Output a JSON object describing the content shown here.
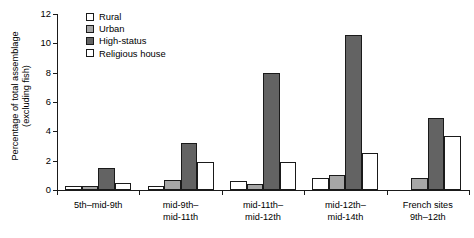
{
  "chart_data": {
    "type": "bar",
    "title": "",
    "xlabel": "",
    "ylabel_line1": "Percentage of total assemblage",
    "ylabel_line2": "(excluding fish)",
    "ylim": [
      0,
      12
    ],
    "yticks": [
      0,
      2,
      4,
      6,
      8,
      10,
      12
    ],
    "ytick_labels": [
      "0",
      "2",
      "4",
      "6",
      "8",
      "10",
      "12"
    ],
    "grid": false,
    "legend_position": "top-left",
    "categories": [
      "5th–mid-9th",
      "mid-9th–\nmid-11th",
      "mid-11th–\nmid-12th",
      "mid-12th–\nmid-14th",
      "French sites\n9th–12th"
    ],
    "category_lines": [
      [
        "5th–mid-9th"
      ],
      [
        "mid-9th–",
        "mid-11th"
      ],
      [
        "mid-11th–",
        "mid-12th"
      ],
      [
        "mid-12th–",
        "mid-14th"
      ],
      [
        "French sites",
        "9th–12th"
      ]
    ],
    "series": [
      {
        "name": "Rural",
        "color": "#ffffff",
        "values": [
          0.3,
          0.3,
          0.6,
          0.85,
          0
        ]
      },
      {
        "name": "Urban",
        "color": "#a6a6a6",
        "values": [
          0.25,
          0.7,
          0.4,
          1.0,
          0.85
        ]
      },
      {
        "name": "High-status",
        "color": "#636363",
        "values": [
          1.5,
          3.2,
          8.0,
          10.6,
          4.9
        ]
      },
      {
        "name": "Religious house",
        "color": "#ffffff",
        "values": [
          0.5,
          1.9,
          1.9,
          2.5,
          3.7
        ]
      }
    ]
  },
  "legend": {
    "items": [
      {
        "label": "Rural",
        "color": "#ffffff"
      },
      {
        "label": "Urban",
        "color": "#a6a6a6"
      },
      {
        "label": "High-status",
        "color": "#636363"
      },
      {
        "label": "Religious house",
        "color": "#ffffff"
      }
    ]
  },
  "axis": {
    "y_title_line1": "Percentage of total assemblage",
    "y_title_line2": "(excluding fish)",
    "tick_labels": [
      "0",
      "2",
      "4",
      "6",
      "8",
      "10",
      "12"
    ]
  },
  "colors": {
    "axis": "#1a1a1a",
    "rural": "#ffffff",
    "urban": "#a6a6a6",
    "high_status": "#636363",
    "religious": "#ffffff"
  }
}
